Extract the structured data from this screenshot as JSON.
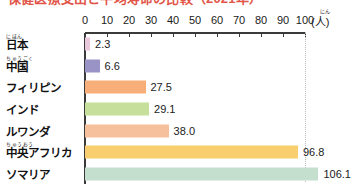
{
  "chart_data": {
    "type": "bar",
    "orientation": "horizontal",
    "title": "保健医療支出と平均寿命の比較（2021年）",
    "title_clipped": true,
    "xlabel": "",
    "ylabel": "",
    "unit": "(人)",
    "unit_ruby": "にん",
    "xlim": [
      0,
      100
    ],
    "xticks": [
      0,
      10,
      20,
      30,
      40,
      50,
      60,
      70,
      80,
      90,
      100
    ],
    "grid": false,
    "gridline_dotted_at": 100,
    "legend": "none",
    "categories": [
      "日本",
      "中国",
      "フィリピン",
      "インド",
      "ルワンダ",
      "中央アフリカ",
      "ソマリア"
    ],
    "category_ruby": [
      "にほん",
      "ちゅうごく",
      "",
      "",
      "",
      "ちゅうおう",
      ""
    ],
    "values": [
      2.3,
      6.6,
      27.5,
      29.1,
      38.0,
      96.8,
      106.1
    ],
    "value_labels": [
      "2.3",
      "6.6",
      "27.5",
      "29.1",
      "38.0",
      "96.8",
      "106.1"
    ],
    "bar_colors": [
      "#E9C8DC",
      "#9A93C6",
      "#F7AE79",
      "#C6E09B",
      "#F5C09B",
      "#F8CE6E",
      "#C5DFCE"
    ]
  },
  "axis": {
    "tick_labels": [
      "0",
      "10",
      "20",
      "30",
      "40",
      "50",
      "60",
      "70",
      "80",
      "90",
      "100"
    ]
  }
}
